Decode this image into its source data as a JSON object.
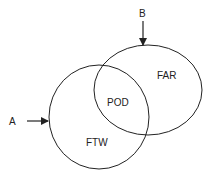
{
  "diagram": {
    "type": "venn",
    "sets": [
      {
        "id": "left",
        "label": "FTW"
      },
      {
        "id": "right",
        "label": "FAR"
      }
    ],
    "intersection_label": "POD",
    "arrows": [
      {
        "label": "A",
        "direction": "right",
        "target": "left"
      },
      {
        "label": "B",
        "direction": "down",
        "target": "right"
      }
    ],
    "stroke_color": "#222222",
    "background": "#ffffff"
  }
}
